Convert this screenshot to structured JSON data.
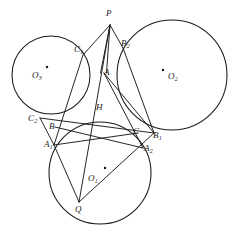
{
  "figure": {
    "type": "geometric-diagram",
    "width": 235,
    "height": 237,
    "stroke_color": "#1a1a1a",
    "background_color": "#ffffff",
    "label_color": "#1a1a1a"
  },
  "circles": [
    {
      "name": "O1",
      "label": "O",
      "sub": "1",
      "cx": 100,
      "cy": 173,
      "r": 51,
      "center_dot_x": 105,
      "center_dot_y": 168,
      "label_x": 88,
      "label_y": 174
    },
    {
      "name": "O2",
      "label": "O",
      "sub": "2",
      "cx": 172,
      "cy": 75,
      "r": 55,
      "center_dot_x": 163,
      "center_dot_y": 70,
      "label_x": 168,
      "label_y": 72
    },
    {
      "name": "O3",
      "label": "O",
      "sub": "3",
      "cx": 51,
      "cy": 75,
      "r": 39,
      "center_dot_x": 47,
      "center_dot_y": 67,
      "label_x": 32,
      "label_y": 71
    }
  ],
  "points": [
    {
      "name": "P",
      "label": "P",
      "sub": "",
      "x": 110,
      "y": 25,
      "label_x": 106,
      "label_y": 9
    },
    {
      "name": "Q",
      "label": "Q",
      "sub": "",
      "x": 79,
      "y": 202,
      "label_x": 75,
      "label_y": 205
    },
    {
      "name": "A",
      "label": "A",
      "sub": "",
      "x": 104,
      "y": 73,
      "label_x": 104,
      "label_y": 68
    },
    {
      "name": "B",
      "label": "B",
      "sub": "",
      "x": 55,
      "y": 127,
      "label_x": 49,
      "label_y": 122
    },
    {
      "name": "C",
      "label": "C",
      "sub": "",
      "x": 138,
      "y": 133,
      "label_x": 133,
      "label_y": 127
    },
    {
      "name": "H",
      "label": "H",
      "sub": "",
      "x": 100,
      "y": 113,
      "label_x": 96,
      "label_y": 103
    },
    {
      "name": "A1",
      "label": "A",
      "sub": "1",
      "x": 54,
      "y": 145,
      "label_x": 44,
      "label_y": 140
    },
    {
      "name": "A2",
      "label": "A",
      "sub": "2",
      "x": 143,
      "y": 148,
      "label_x": 144,
      "label_y": 144
    },
    {
      "name": "B1",
      "label": "B",
      "sub": "1",
      "x": 154,
      "y": 133,
      "label_x": 153,
      "label_y": 131
    },
    {
      "name": "B2",
      "label": "B",
      "sub": "2",
      "x": 123,
      "y": 48,
      "label_x": 121,
      "label_y": 39
    },
    {
      "name": "C1",
      "label": "C",
      "sub": "1",
      "x": 83,
      "y": 55,
      "label_x": 74,
      "label_y": 45
    },
    {
      "name": "C2",
      "label": "C",
      "sub": "2",
      "x": 40,
      "y": 118,
      "label_x": 28,
      "label_y": 114
    }
  ],
  "segments": [
    {
      "name": "P-C1",
      "from": "P",
      "to": "C1"
    },
    {
      "name": "P-B2",
      "from": "P",
      "to": "B2"
    },
    {
      "name": "P-A-left",
      "from": "P",
      "to": "A"
    },
    {
      "name": "P-A-right",
      "from": "P",
      "to": "A"
    },
    {
      "name": "P-Q",
      "from": "P",
      "to": "Q"
    },
    {
      "name": "C1-A1",
      "from": "C1",
      "to": "A1"
    },
    {
      "name": "B2-B1",
      "from": "B2",
      "to": "B1"
    },
    {
      "name": "C2-B1",
      "from": "C2",
      "to": "B1"
    },
    {
      "name": "C2-A1",
      "from": "C2",
      "to": "A1"
    },
    {
      "name": "Q-A1",
      "from": "Q",
      "to": "A1"
    },
    {
      "name": "Q-B1",
      "from": "Q",
      "to": "B1"
    },
    {
      "name": "A1-C",
      "from": "A1",
      "to": "C"
    },
    {
      "name": "B-A2",
      "from": "B",
      "to": "A2"
    },
    {
      "name": "A-B1",
      "from": "A",
      "to": "B1"
    },
    {
      "name": "A-A2",
      "from": "A",
      "to": "A2"
    }
  ],
  "labels": {
    "P": "P",
    "Q": "Q",
    "A": "A",
    "B": "B",
    "C": "C",
    "H": "H",
    "A1": "A",
    "A2": "A",
    "B1": "B",
    "B2": "B",
    "C1": "C",
    "C2": "C",
    "O1": "O",
    "O2": "O",
    "O3": "O",
    "sub1": "1",
    "sub2": "2",
    "sub3": "3"
  }
}
